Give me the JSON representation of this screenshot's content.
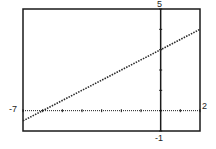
{
  "chart_data": {
    "type": "line",
    "title": "",
    "xlabel": "",
    "ylabel": "",
    "xlim": [
      -7,
      2
    ],
    "ylim": [
      -1,
      5
    ],
    "tick_labels": {
      "xmin": "-7",
      "xmax": "2",
      "ymin": "-1",
      "ymax": "5"
    },
    "grid": false,
    "series": [
      {
        "name": "y = 0.5x + 3",
        "style": "dotted",
        "x": [
          -7,
          2
        ],
        "y": [
          -0.5,
          4
        ]
      }
    ]
  },
  "colors": {
    "axis": "#1a1a1a",
    "line": "#2a2a2a",
    "frame": "#1a1a1a"
  }
}
